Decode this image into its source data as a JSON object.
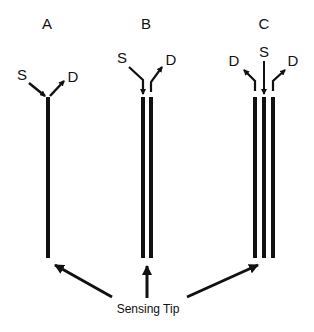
{
  "panels": [
    {
      "label": "A",
      "source": "S",
      "drains": [
        "D"
      ]
    },
    {
      "label": "B",
      "source": "S",
      "drains": [
        "D"
      ]
    },
    {
      "label": "C",
      "source": "S",
      "drains": [
        "D",
        "D"
      ]
    }
  ],
  "caption": "Sensing Tip",
  "colors": {
    "ink": "#111111",
    "background": "#ffffff"
  }
}
